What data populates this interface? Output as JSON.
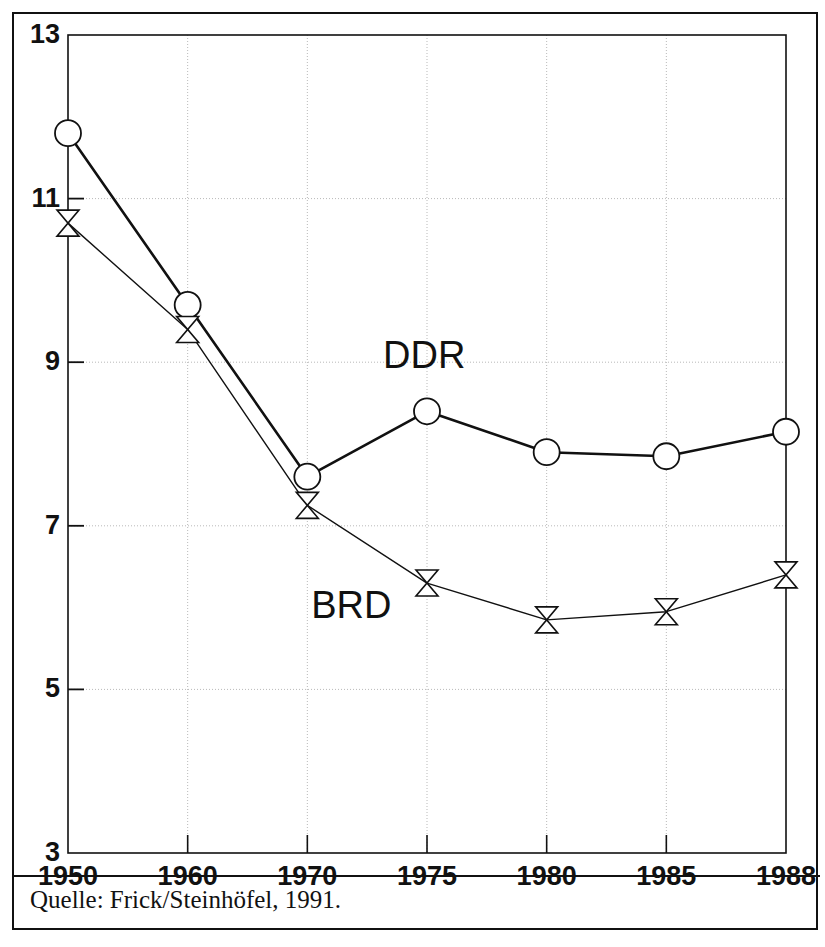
{
  "figure": {
    "source_caption": "Quelle: Frick/Steinhöfel, 1991."
  },
  "chart_data": {
    "type": "line",
    "title": "",
    "subtitle": "",
    "xlabel": "",
    "ylabel": "",
    "categories": [
      "1950",
      "1960",
      "1970",
      "1975",
      "1980",
      "1985",
      "1988"
    ],
    "x_tick_labels": [
      "1950",
      "1960",
      "1970",
      "1975",
      "1980",
      "1985",
      "1988"
    ],
    "y_tick_labels": [
      "3",
      "5",
      "7",
      "9",
      "11",
      "13"
    ],
    "y_ticks": [
      3,
      5,
      7,
      9,
      11,
      13
    ],
    "ylim": [
      3,
      13
    ],
    "grid": true,
    "grid_style": "dotted",
    "legend_position": "inline-annotation",
    "series": [
      {
        "name": "DDR",
        "label": "DDR",
        "marker": "circle",
        "line_width": 2.6,
        "color": "#111111",
        "values": [
          11.8,
          9.7,
          7.6,
          8.4,
          7.9,
          7.85,
          8.15
        ]
      },
      {
        "name": "BRD",
        "label": "BRD",
        "marker": "bowtie",
        "line_width": 1.4,
        "color": "#111111",
        "values": [
          10.7,
          9.4,
          7.25,
          6.3,
          5.85,
          5.95,
          6.4
        ]
      }
    ],
    "annotations": [
      {
        "text": "DDR",
        "x_category": "1975",
        "y_value": 9.05
      },
      {
        "text": "BRD",
        "x_category": "1972",
        "y_value": 6.0
      }
    ]
  }
}
